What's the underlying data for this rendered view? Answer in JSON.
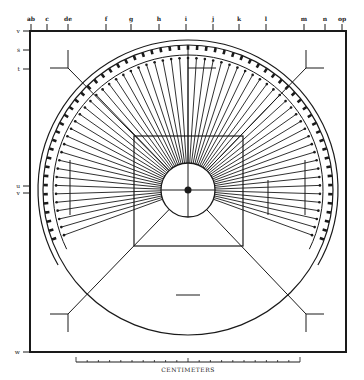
{
  "figure": {
    "type": "technical diagram",
    "ink_color": "#1a1a1a",
    "paper_color": "#ffffff"
  },
  "top_ticks": [
    {
      "label": "ab",
      "x": 31
    },
    {
      "label": "c",
      "x": 47
    },
    {
      "label": "de",
      "x": 68
    },
    {
      "label": "f",
      "x": 106
    },
    {
      "label": "g",
      "x": 131
    },
    {
      "label": "h",
      "x": 159
    },
    {
      "label": "i",
      "x": 186
    },
    {
      "label": "j",
      "x": 213
    },
    {
      "label": "k",
      "x": 239
    },
    {
      "label": "l",
      "x": 266
    },
    {
      "label": "m",
      "x": 304
    },
    {
      "label": "n",
      "x": 325
    },
    {
      "label": "op",
      "x": 342
    }
  ],
  "left_ticks": [
    {
      "label": "v",
      "y": 31
    },
    {
      "label": "s",
      "y": 50
    },
    {
      "label": "t",
      "y": 69
    },
    {
      "label": "u",
      "y": 186
    },
    {
      "label": "v",
      "y": 193
    },
    {
      "label": "w",
      "y": 352
    }
  ],
  "scale_bar": {
    "label": "CENTIMETERS",
    "x_start": 76,
    "x_end": 300,
    "y": 362,
    "divisions": 20
  },
  "geometry": {
    "frame": {
      "x": 30,
      "y": 31,
      "w": 316,
      "h": 321
    },
    "center": {
      "x": 188,
      "y": 190
    },
    "inner_circle_r": 27,
    "square": {
      "x": 134,
      "y": 136,
      "w": 109,
      "h": 110
    },
    "outer_arc_r": 145,
    "spoke_outer_r": 132,
    "band_inner_r": 135,
    "band_outer_r": 150,
    "spoke_count": 60
  }
}
